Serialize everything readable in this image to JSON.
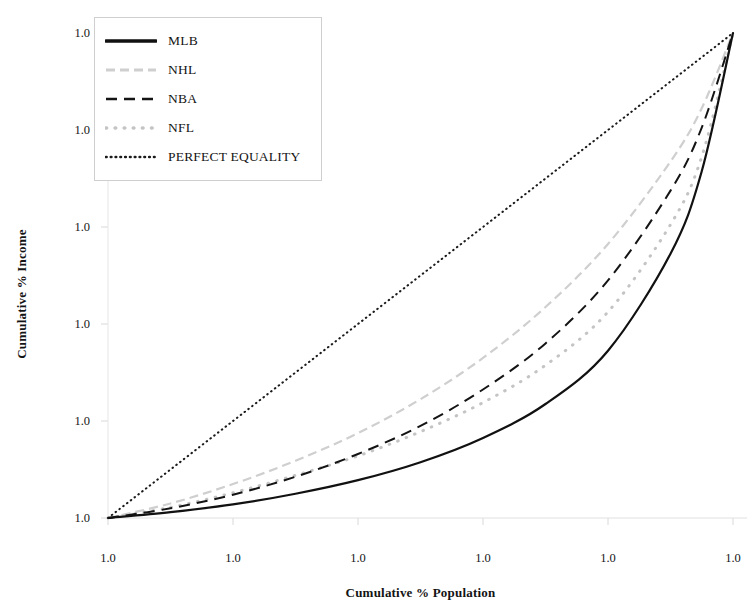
{
  "chart_data": {
    "type": "line",
    "title": "",
    "xlabel": "Cumulative % Population",
    "ylabel": "Cumulative % Income",
    "xlim": [
      0,
      1
    ],
    "ylim": [
      0,
      1
    ],
    "grid": false,
    "legend_position": "upper-left",
    "xticklabels": [
      "1.0",
      "1.0",
      "1.0",
      "1.0",
      "1.0",
      "1.0"
    ],
    "yticklabels": [
      "1.0",
      "1.0",
      "1.0",
      "1.0",
      "1.0",
      "1.0"
    ],
    "xtick_values": [
      0.0,
      0.2,
      0.4,
      0.6,
      0.8,
      1.0
    ],
    "ytick_values": [
      0.0,
      0.2,
      0.4,
      0.6,
      0.8,
      1.0
    ],
    "series": [
      {
        "name": "MLB",
        "style": "solid",
        "color": "#111111",
        "x": [
          0.0,
          0.1,
          0.2,
          0.3,
          0.4,
          0.5,
          0.6,
          0.7,
          0.8,
          0.9,
          0.95,
          1.0
        ],
        "y": [
          0.0,
          0.012,
          0.028,
          0.05,
          0.078,
          0.115,
          0.165,
          0.235,
          0.345,
          0.545,
          0.715,
          1.0
        ]
      },
      {
        "name": "NHL",
        "style": "dashed-light",
        "color": "#cfcfcf",
        "x": [
          0.0,
          0.1,
          0.2,
          0.3,
          0.4,
          0.5,
          0.6,
          0.7,
          0.8,
          0.9,
          0.95,
          1.0
        ],
        "y": [
          0.0,
          0.03,
          0.07,
          0.118,
          0.175,
          0.245,
          0.33,
          0.435,
          0.565,
          0.735,
          0.845,
          1.0
        ]
      },
      {
        "name": "NBA",
        "style": "dashed",
        "color": "#141414",
        "x": [
          0.0,
          0.1,
          0.2,
          0.3,
          0.4,
          0.5,
          0.6,
          0.7,
          0.8,
          0.9,
          0.95,
          1.0
        ],
        "y": [
          0.0,
          0.02,
          0.048,
          0.085,
          0.132,
          0.19,
          0.265,
          0.36,
          0.49,
          0.675,
          0.805,
          1.0
        ]
      },
      {
        "name": "NFL",
        "style": "dotted-light",
        "color": "#c4c4c4",
        "x": [
          0.0,
          0.1,
          0.2,
          0.3,
          0.4,
          0.5,
          0.6,
          0.7,
          0.8,
          0.9,
          0.95,
          1.0
        ],
        "y": [
          0.0,
          0.022,
          0.052,
          0.088,
          0.128,
          0.178,
          0.238,
          0.315,
          0.425,
          0.605,
          0.745,
          1.0
        ]
      },
      {
        "name": "PERFECT EQUALITY",
        "style": "dotted",
        "color": "#1a1a1a",
        "x": [
          0.0,
          1.0
        ],
        "y": [
          0.0,
          1.0
        ]
      }
    ]
  },
  "legend": {
    "items": [
      {
        "label": "MLB"
      },
      {
        "label": "NHL"
      },
      {
        "label": "NBA"
      },
      {
        "label": "NFL"
      },
      {
        "label": "PERFECT EQUALITY"
      }
    ]
  }
}
